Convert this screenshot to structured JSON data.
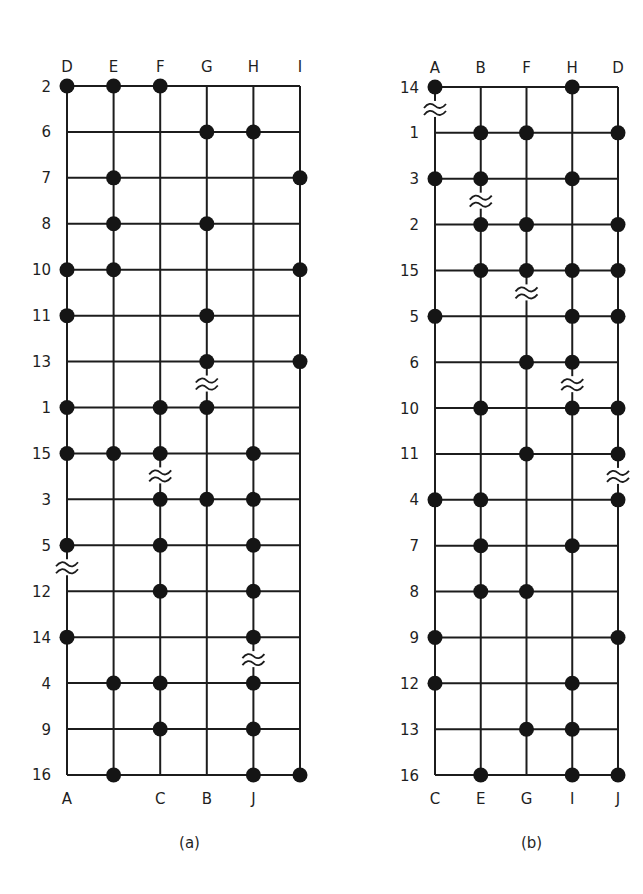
{
  "figure": {
    "panels": [
      {
        "id": "a",
        "caption": "(a)",
        "origin": {
          "x": 67,
          "y": 86
        },
        "col_spacing": 46.6,
        "row_spacing": 45.93,
        "top_labels": [
          "D",
          "E",
          "F",
          "G",
          "H",
          "I"
        ],
        "bottom_labels": [
          "A",
          "",
          "C",
          "B",
          "J",
          ""
        ],
        "row_labels": [
          "2",
          "6",
          "7",
          "8",
          "10",
          "11",
          "13",
          "1",
          "15",
          "3",
          "5",
          "12",
          "14",
          "4",
          "9",
          "16"
        ],
        "dots": [
          [
            0,
            1,
            2
          ],
          [
            3,
            4
          ],
          [
            1,
            5
          ],
          [
            1,
            3
          ],
          [
            0,
            1,
            5
          ],
          [
            0,
            3
          ],
          [
            3,
            5
          ],
          [
            0,
            2,
            3
          ],
          [
            0,
            1,
            2,
            4
          ],
          [
            2,
            3,
            4
          ],
          [
            0,
            2,
            4
          ],
          [
            2,
            4
          ],
          [
            0,
            4
          ],
          [
            1,
            2,
            4
          ],
          [
            2,
            4
          ],
          [
            1,
            4,
            5
          ]
        ],
        "breaks": [
          {
            "col": 3,
            "between_rows": [
              6,
              7
            ]
          },
          {
            "col": 2,
            "between_rows": [
              8,
              9
            ]
          },
          {
            "col": 0,
            "between_rows": [
              10,
              11
            ]
          },
          {
            "col": 4,
            "between_rows": [
              12,
              13
            ]
          }
        ]
      },
      {
        "id": "b",
        "caption": "(b)",
        "origin": {
          "x": 435,
          "y": 87
        },
        "col_spacing": 45.75,
        "row_spacing": 45.87,
        "top_labels": [
          "A",
          "B",
          "F",
          "H",
          "D"
        ],
        "bottom_labels": [
          "C",
          "E",
          "G",
          "I",
          "J"
        ],
        "row_labels": [
          "14",
          "1",
          "3",
          "2",
          "15",
          "5",
          "6",
          "10",
          "11",
          "4",
          "7",
          "8",
          "9",
          "12",
          "13",
          "16"
        ],
        "dots": [
          [
            0,
            3
          ],
          [
            1,
            2,
            4
          ],
          [
            0,
            1,
            3
          ],
          [
            1,
            2,
            4
          ],
          [
            1,
            2,
            3,
            4
          ],
          [
            0,
            3,
            4
          ],
          [
            2,
            3
          ],
          [
            1,
            3,
            4
          ],
          [
            2,
            4
          ],
          [
            0,
            1,
            4
          ],
          [
            1,
            3
          ],
          [
            1,
            2
          ],
          [
            0,
            4
          ],
          [
            0,
            3
          ],
          [
            2,
            3
          ],
          [
            1,
            3,
            4
          ]
        ],
        "breaks": [
          {
            "col": 0,
            "between_rows": [
              0,
              1
            ]
          },
          {
            "col": 1,
            "between_rows": [
              2,
              3
            ]
          },
          {
            "col": 2,
            "between_rows": [
              4,
              5
            ]
          },
          {
            "col": 3,
            "between_rows": [
              6,
              7
            ]
          },
          {
            "col": 4,
            "between_rows": [
              8,
              9
            ]
          }
        ]
      }
    ],
    "colors": {
      "line": "#1c1c1c",
      "dot": "#151515",
      "background": "#ffffff"
    }
  }
}
